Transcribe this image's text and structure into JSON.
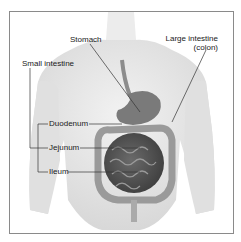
{
  "diagram": {
    "labels": {
      "stomach": "Stomach",
      "large_intestine_line1": "Large intestine",
      "large_intestine_line2": "(colon)",
      "small_intestine": "Small intestine",
      "duodenum": "Duodenum",
      "jejunum": "Jejunum",
      "ileum": "Ileum"
    },
    "colors": {
      "frame_border": "#8a8a8a",
      "body_fill": "#ececec",
      "body_shade": "#d4d4d4",
      "organ_dark": "#5a5a5a",
      "organ_mid": "#8c8c8c",
      "leader_line": "#333333",
      "text": "#1a1a1a"
    }
  }
}
